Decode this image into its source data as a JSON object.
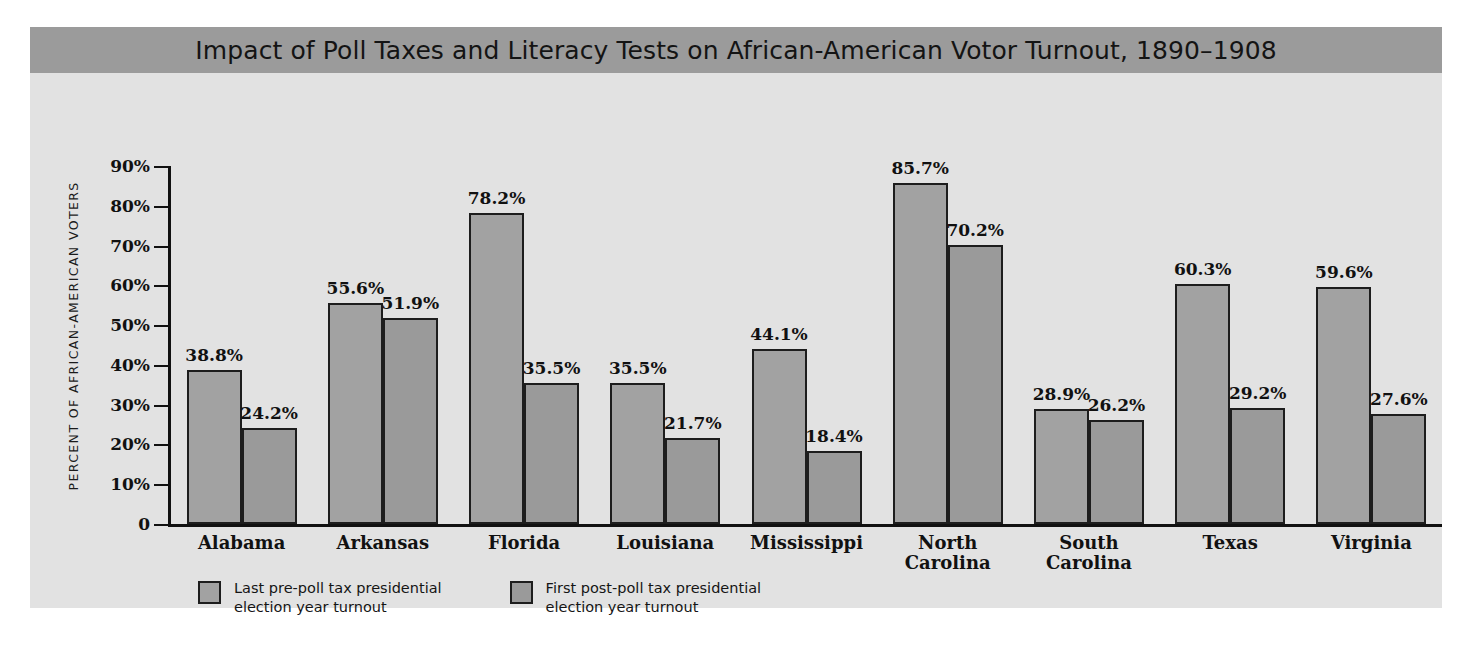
{
  "chart_data": {
    "type": "bar",
    "title": "Impact of Poll Taxes and Literacy Tests on African-American Votor Turnout, 1890–1908",
    "xlabel": "",
    "ylabel": "PERCENT OF AFRICAN-AMERICAN VOTERS",
    "ylim": [
      0,
      90
    ],
    "grid": false,
    "legend_position": "bottom-left",
    "ytick_labels": [
      "90%",
      "80%",
      "70%",
      "60%",
      "50%",
      "40%",
      "30%",
      "20%",
      "10%",
      "0"
    ],
    "ytick_values": [
      90,
      80,
      70,
      60,
      50,
      40,
      30,
      20,
      10,
      0
    ],
    "categories": [
      "Alabama",
      "Arkansas",
      "Florida",
      "Louisiana",
      "Mississippi",
      "North\nCarolina",
      "South\nCarolina",
      "Texas",
      "Virginia"
    ],
    "series": [
      {
        "name": "Last pre-poll tax presidential\nelection year turnout",
        "values": [
          38.8,
          55.6,
          78.2,
          35.5,
          44.1,
          85.7,
          28.9,
          60.3,
          59.6
        ],
        "labels": [
          "38.8%",
          "55.6%",
          "78.2%",
          "35.5%",
          "44.1%",
          "85.7%",
          "28.9%",
          "60.3%",
          "59.6%"
        ],
        "color": "#a2a2a2"
      },
      {
        "name": "First post-poll tax presidential\nelection year turnout",
        "values": [
          24.2,
          51.9,
          35.5,
          21.7,
          18.4,
          70.2,
          26.2,
          29.2,
          27.6
        ],
        "labels": [
          "24.2%",
          "51.9%",
          "35.5%",
          "21.7%",
          "18.4%",
          "70.2%",
          "26.2%",
          "29.2%",
          "27.6%"
        ],
        "color": "#9a9a9a"
      }
    ]
  },
  "colors": {
    "title_band": "#9b9b9b",
    "panel": "#e2e2e2",
    "axis": "#111111",
    "bar_outline": "#1d1d1d",
    "series_1": "#a2a2a2",
    "series_2": "#9a9a9a"
  }
}
